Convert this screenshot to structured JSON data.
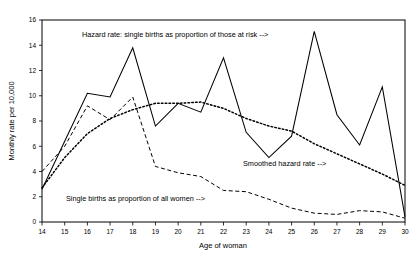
{
  "chart_data": {
    "type": "line",
    "title": "",
    "xlabel": "Age of woman",
    "ylabel": "Monthly rate per 10,000",
    "xlim": [
      14,
      30
    ],
    "ylim": [
      0,
      16
    ],
    "xticks": [
      14,
      15,
      16,
      17,
      18,
      19,
      20,
      21,
      22,
      23,
      24,
      25,
      26,
      27,
      28,
      29,
      30
    ],
    "yticks": [
      0,
      2,
      4,
      6,
      8,
      10,
      12,
      14,
      16
    ],
    "xtick_labels": [
      "14",
      "15",
      "16",
      "17",
      "18",
      "19",
      "20",
      "21",
      "22",
      "23",
      "24",
      "25",
      "26",
      "27",
      "28",
      "29",
      "30"
    ],
    "ytick_labels": [
      "0",
      "2",
      "4",
      "6",
      "8",
      "10",
      "12",
      "14",
      "16"
    ],
    "grid": false,
    "legend": "annotations",
    "x": [
      14,
      15,
      16,
      17,
      18,
      19,
      20,
      21,
      22,
      23,
      24,
      25,
      26,
      27,
      28,
      29,
      30
    ],
    "series": [
      {
        "name": "Hazard rate: single births as proportion of those at risk",
        "style": "solid",
        "values": [
          2.6,
          6.4,
          10.2,
          9.9,
          13.8,
          7.6,
          9.4,
          8.7,
          13.0,
          7.1,
          5.1,
          6.8,
          15.1,
          8.5,
          6.1,
          10.7,
          0.4
        ]
      },
      {
        "name": "Single births as proportion of all women",
        "style": "dashed",
        "values": [
          4.0,
          6.0,
          9.2,
          8.1,
          9.9,
          4.4,
          3.9,
          3.6,
          2.5,
          2.4,
          1.8,
          1.1,
          0.7,
          0.6,
          0.9,
          0.8,
          0.3
        ]
      },
      {
        "name": "Smoothed hazard rate",
        "style": "dotted",
        "values": [
          2.7,
          5.1,
          7.0,
          8.2,
          8.9,
          9.4,
          9.4,
          9.5,
          9.0,
          8.2,
          7.6,
          7.2,
          6.2,
          5.4,
          4.6,
          3.8,
          2.9
        ]
      }
    ],
    "annotations": [
      {
        "name": "hazard-rate-annotation",
        "text": "Hazard rate: single births as proportion of those at risk -->",
        "x_px": 82,
        "y_px": 37
      },
      {
        "name": "smoothed-hazard-annotation",
        "text": "Smoothed hazard rate -->",
        "x_px": 243,
        "y_px": 166
      },
      {
        "name": "single-births-annotation",
        "text": "Single births as proportion of all women -->",
        "x_px": 66,
        "y_px": 201
      }
    ]
  }
}
